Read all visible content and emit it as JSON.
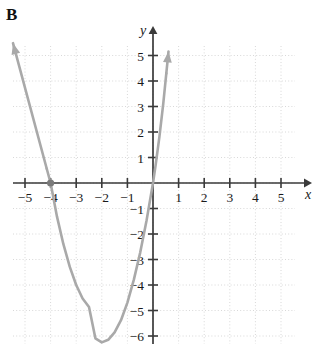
{
  "panel": {
    "label": "B"
  },
  "chart_data": {
    "type": "line",
    "title": "",
    "subtitle": "",
    "xlabel": "x",
    "ylabel": "y",
    "xlim": [
      -5.5,
      5.6
    ],
    "ylim": [
      -6.9,
      5.8
    ],
    "grid": true,
    "grid_style": "dotted",
    "legend": "none",
    "curve": {
      "name": "parabola",
      "shape": "upward-opening parabola",
      "equation": "y = 1.56(x + 2)^2 - 6.25",
      "vertex": [
        -2,
        -6.25
      ],
      "x_intercepts": [
        -4,
        0
      ],
      "y_intercept": 0,
      "color": "#a9a9a9",
      "stroke_width": 2.6,
      "arrowheads": [
        "upper-left",
        "upper-right"
      ],
      "points": [
        [
          -4.15,
          0.56
        ],
        [
          -4.0,
          0.0
        ],
        [
          -3.75,
          -1.32
        ],
        [
          -3.5,
          -2.4
        ],
        [
          -3.25,
          -3.29
        ],
        [
          -3.0,
          -4.0
        ],
        [
          -2.75,
          -4.53
        ],
        [
          -2.5,
          -4.86
        ],
        [
          -2.25,
          -6.09
        ],
        [
          -2.0,
          -6.25
        ],
        [
          -1.75,
          -6.15
        ],
        [
          -1.5,
          -5.86
        ],
        [
          -1.25,
          -5.38
        ],
        [
          -1.0,
          -4.69
        ],
        [
          -0.75,
          -3.8
        ],
        [
          -0.5,
          -2.73
        ],
        [
          -0.25,
          -1.46
        ],
        [
          0.0,
          0.0
        ],
        [
          0.1,
          0.68
        ],
        [
          0.25,
          1.81
        ],
        [
          0.4,
          3.1
        ],
        [
          0.52,
          4.3
        ]
      ]
    },
    "markers": [
      {
        "name": "x-intercept-marker",
        "x": -4,
        "y": 0,
        "style": "filled-dot",
        "color": "#7a7a7a"
      }
    ],
    "x_ticks": [
      {
        "value": -5,
        "label": "−5"
      },
      {
        "value": -4,
        "label": "−4"
      },
      {
        "value": -3,
        "label": "−3"
      },
      {
        "value": -2,
        "label": "−2"
      },
      {
        "value": -1,
        "label": "−1"
      },
      {
        "value": 1,
        "label": "1"
      },
      {
        "value": 2,
        "label": "2"
      },
      {
        "value": 3,
        "label": "3"
      },
      {
        "value": 4,
        "label": "4"
      },
      {
        "value": 5,
        "label": "5"
      }
    ],
    "y_ticks": [
      {
        "value": 5,
        "label": "5"
      },
      {
        "value": 4,
        "label": "4"
      },
      {
        "value": 3,
        "label": "3"
      },
      {
        "value": 2,
        "label": "2"
      },
      {
        "value": 1,
        "label": "1"
      },
      {
        "value": -1,
        "label": "−1"
      },
      {
        "value": -2,
        "label": "−2"
      },
      {
        "value": -3,
        "label": "−3"
      },
      {
        "value": -4,
        "label": "−4"
      },
      {
        "value": -5,
        "label": "−5"
      },
      {
        "value": -6,
        "label": "−6"
      }
    ],
    "colors": {
      "axis": "#3a3a3a",
      "grid": "#d8d8d8",
      "curve": "#a9a9a9",
      "text": "#1a1a1a"
    }
  }
}
